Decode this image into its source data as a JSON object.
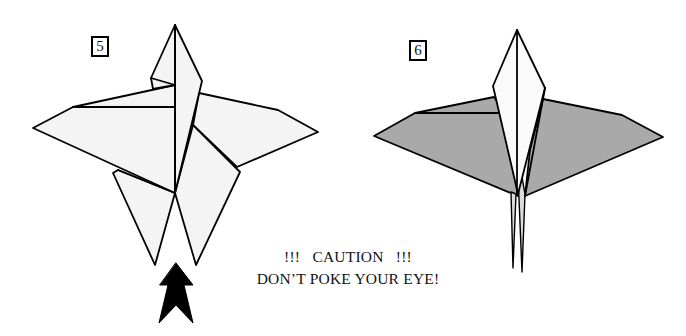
{
  "figure_5": {
    "step_label": "5",
    "paper_fill": "#f4f4f4",
    "line_color": "#000000",
    "arrow_color": "#000000",
    "arrow_icon": "push-up-arrow-icon"
  },
  "figure_6": {
    "step_label": "6",
    "wing_fill": "#a9a9a9",
    "head_fill": "#fafafa",
    "line_color": "#000000"
  },
  "caution": {
    "line1": "!!!   CAUTION   !!!",
    "line2": "DON’T POKE YOUR EYE!"
  }
}
